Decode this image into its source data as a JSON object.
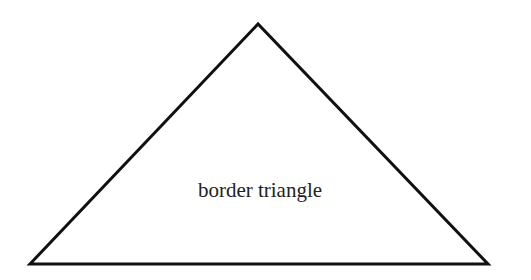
{
  "diagram": {
    "shape": "triangle",
    "label": "border triangle",
    "stroke_color": "#111111",
    "fill_color": "#ffffff",
    "text_color": "#222222"
  }
}
